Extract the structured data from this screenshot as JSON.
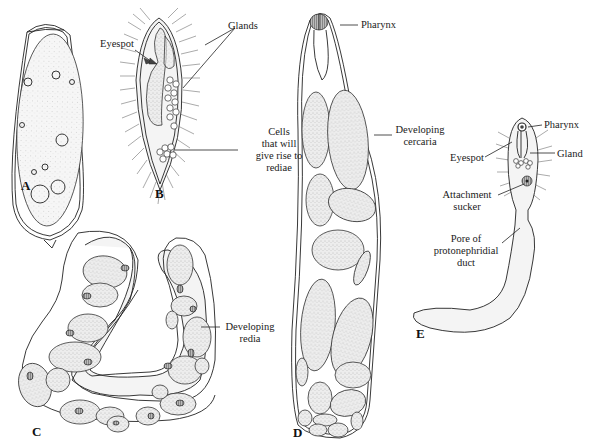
{
  "figure": {
    "panels": [
      {
        "id": "A",
        "letter": "A",
        "labels": []
      },
      {
        "id": "B",
        "letter": "B",
        "labels": [
          {
            "text": "Eyespot"
          },
          {
            "text": "Glands"
          },
          {
            "lines": [
              "Cells",
              "that will",
              "give rise to",
              "rediae"
            ]
          }
        ]
      },
      {
        "id": "C",
        "letter": "C",
        "labels": [
          {
            "lines": [
              "Developing",
              "redia"
            ]
          }
        ]
      },
      {
        "id": "D",
        "letter": "D",
        "labels": [
          {
            "text": "Pharynx"
          },
          {
            "lines": [
              "Developing",
              "cercaria"
            ]
          }
        ]
      },
      {
        "id": "E",
        "letter": "E",
        "labels": [
          {
            "text": "Pharynx"
          },
          {
            "text": "Eyespot"
          },
          {
            "text": "Gland"
          },
          {
            "lines": [
              "Attachment",
              "sucker"
            ]
          },
          {
            "lines": [
              "Pore of",
              "protonephridial",
              "duct"
            ]
          }
        ]
      }
    ]
  }
}
